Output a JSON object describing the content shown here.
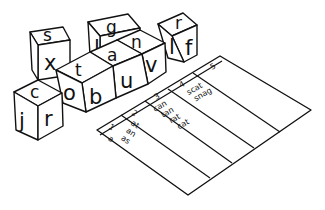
{
  "cubes": [
    {
      "id": "sx",
      "top": "s",
      "front": "x"
    },
    {
      "id": "g",
      "top": "g",
      "front": "l"
    },
    {
      "id": "rlf",
      "top": "r",
      "left": "l",
      "front": "f"
    },
    {
      "id": "an",
      "top": "n",
      "front": "v"
    },
    {
      "id": "ta",
      "top": "a",
      "front": "u"
    },
    {
      "id": "xo",
      "top": "t",
      "left": "o",
      "front": "b"
    },
    {
      "id": "cjr",
      "top": "c",
      "left": "j",
      "front": "r"
    }
  ],
  "chart": {
    "columns": [
      {
        "header": "1",
        "words": [
          "a"
        ]
      },
      {
        "header": "2",
        "words": [
          "at",
          "an",
          "as"
        ]
      },
      {
        "header": "3",
        "words": [
          "can",
          "tan",
          "rat",
          "cat"
        ]
      },
      {
        "header": "4",
        "words": [
          "scat",
          "snag"
        ]
      },
      {
        "header": "5",
        "words": []
      }
    ]
  }
}
